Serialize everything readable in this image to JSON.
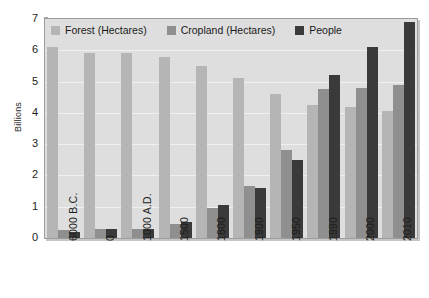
{
  "chart_data": {
    "type": "bar",
    "title": "",
    "subtitle": "",
    "xlabel": "",
    "ylabel": "Billions",
    "ylim": [
      0,
      7
    ],
    "ytick_values": [
      0,
      1,
      2,
      3,
      4,
      5,
      6,
      7
    ],
    "ytick_labels": [
      "0",
      "1",
      "2",
      "3",
      "4",
      "5",
      "6",
      "7"
    ],
    "grid": true,
    "legend_position": "top-left-inside",
    "categories": [
      "6000 B.C.",
      "0",
      "1000 A.D.",
      "1500",
      "1800",
      "1900",
      "1950",
      "1990",
      "2000",
      "2010"
    ],
    "series": [
      {
        "name": "Forest (Hectares)",
        "color": "#b5b5b5",
        "values": [
          6.1,
          5.9,
          5.9,
          5.78,
          5.5,
          5.1,
          4.6,
          4.25,
          4.2,
          4.05
        ]
      },
      {
        "name": "Cropland (Hectares)",
        "color": "#8f8f8f",
        "values": [
          0.25,
          0.3,
          0.3,
          0.45,
          0.95,
          1.65,
          2.8,
          4.75,
          4.8,
          4.9
        ]
      },
      {
        "name": "People",
        "color": "#3a3a3a",
        "values": [
          0.2,
          0.3,
          0.3,
          0.5,
          1.05,
          1.6,
          2.5,
          5.2,
          6.1,
          6.9
        ]
      }
    ]
  },
  "axis": {
    "y_title": "Billions"
  },
  "legend": {
    "items": [
      {
        "label": "Forest (Hectares)",
        "color": "#b5b5b5"
      },
      {
        "label": "Cropland (Hectares)",
        "color": "#8f8f8f"
      },
      {
        "label": "People",
        "color": "#3a3a3a"
      }
    ]
  },
  "colors": {
    "plot_background": "#dedede",
    "plot_border": "#9c9c9c",
    "page_background": "#ffffff",
    "text": "#1d1d1d",
    "gridline": "#f0f0f0"
  }
}
